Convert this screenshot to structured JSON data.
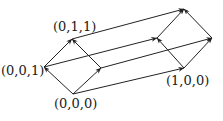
{
  "diagram": {
    "type": "directed-lattice",
    "stroke_color": "#222222",
    "vertices": [
      {
        "id": "v001",
        "label": "(0,0,1)",
        "x": 44,
        "y": 67
      },
      {
        "id": "v011",
        "label": "(0,1,1)",
        "x": 72,
        "y": 39
      },
      {
        "id": "vmid",
        "label": "",
        "x": 101,
        "y": 68
      },
      {
        "id": "v000",
        "label": "(0,0,0)",
        "x": 73,
        "y": 94
      },
      {
        "id": "vP",
        "label": "",
        "x": 157,
        "y": 38
      },
      {
        "id": "vTR",
        "label": "",
        "x": 184,
        "y": 9
      },
      {
        "id": "vR",
        "label": "",
        "x": 212,
        "y": 38
      },
      {
        "id": "v100",
        "label": "(1,0,0)",
        "x": 184,
        "y": 68
      }
    ],
    "edges": [
      {
        "from": "v000",
        "to": "v001"
      },
      {
        "from": "v001",
        "to": "v011"
      },
      {
        "from": "vmid",
        "to": "v011"
      },
      {
        "from": "v000",
        "to": "vmid"
      },
      {
        "from": "v100",
        "to": "vP"
      },
      {
        "from": "vP",
        "to": "vTR"
      },
      {
        "from": "vR",
        "to": "vTR"
      },
      {
        "from": "v100",
        "to": "vR"
      },
      {
        "from": "v011",
        "to": "vTR"
      },
      {
        "from": "v001",
        "to": "vP"
      },
      {
        "from": "vmid",
        "to": "vR"
      },
      {
        "from": "v000",
        "to": "v100"
      }
    ]
  },
  "labels": {
    "v001": "(0,0,1)",
    "v011": "(0,1,1)",
    "v000": "(0,0,0)",
    "v100": "(1,0,0)"
  }
}
